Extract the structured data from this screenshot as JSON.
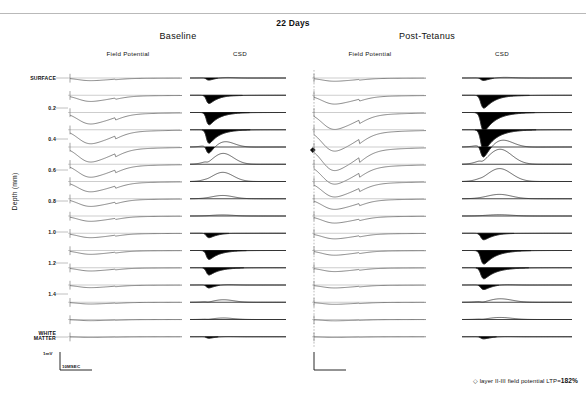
{
  "figure": {
    "title": "22 Days",
    "conditions": [
      {
        "key": "baseline",
        "label": "Baseline"
      },
      {
        "key": "post",
        "label": "Post-Tetanus"
      }
    ],
    "column_labels": {
      "field_potential": "Field Potential",
      "csd": "CSD"
    },
    "y_axis_label": "Depth  (mm)",
    "depth_ticks": [
      {
        "label": "SURFACE",
        "value": 0.0,
        "y": 78
      },
      {
        "label": "0.2",
        "value": 0.2,
        "y": 108
      },
      {
        "label": "0.4",
        "value": 0.4,
        "y": 139
      },
      {
        "label": "0.6",
        "value": 0.6,
        "y": 170
      },
      {
        "label": "0.8",
        "value": 0.8,
        "y": 201
      },
      {
        "label": "1.0",
        "value": 1.0,
        "y": 232
      },
      {
        "label": "1.2",
        "value": 1.2,
        "y": 263
      },
      {
        "label": "1.4",
        "value": 1.4,
        "y": 294
      },
      {
        "label": "WHITE\nMATTER",
        "value": 1.7,
        "y": 337
      }
    ],
    "scale_bar": {
      "voltage": "1mV",
      "time": "10MSEC"
    },
    "annotation": {
      "marker": "◇",
      "text": "layer II-III field potential LTP=",
      "value": "182%"
    }
  },
  "chart_data": {
    "type": "line",
    "title": "22 Days",
    "ylabel": "Depth  (mm)",
    "xlabel": "",
    "ylim": [
      0.0,
      1.7
    ],
    "grid": false,
    "legend": "none",
    "n_channels": 16,
    "channel_depths_mm": [
      0.0,
      0.1,
      0.2,
      0.3,
      0.4,
      0.5,
      0.6,
      0.7,
      0.8,
      0.9,
      1.0,
      1.1,
      1.2,
      1.3,
      1.4,
      1.7
    ],
    "panels": [
      {
        "condition": "Baseline",
        "field_potential": {
          "units": "mV",
          "peak_negativity_mV": [
            -0.18,
            -0.42,
            -0.78,
            -0.95,
            -1.02,
            -0.88,
            -0.7,
            -0.52,
            -0.36,
            -0.3,
            -0.26,
            -0.22,
            -0.18,
            -0.12,
            -0.08,
            -0.04
          ]
        },
        "csd": {
          "units": "mV/mm^2",
          "sink_amplitude": [
            0.3,
            1.0,
            1.45,
            1.6,
            1.1,
            0.25,
            0.05,
            0.0,
            0.0,
            0.55,
            1.05,
            0.85,
            0.4,
            0.1,
            0.05,
            0.2
          ],
          "source_amplitude": [
            0.1,
            0.05,
            0.0,
            0.0,
            0.7,
            1.05,
            0.85,
            0.3,
            0.1,
            0.05,
            0.0,
            0.0,
            0.1,
            0.25,
            0.15,
            0.05
          ]
        }
      },
      {
        "condition": "Post-Tetanus",
        "field_potential": {
          "units": "mV",
          "peak_negativity_mV": [
            -0.22,
            -0.6,
            -1.15,
            -1.45,
            -1.6,
            -1.35,
            -1.05,
            -0.72,
            -0.48,
            -0.38,
            -0.32,
            -0.26,
            -0.2,
            -0.14,
            -0.09,
            -0.04
          ]
        },
        "csd": {
          "units": "mV/mm^2",
          "sink_amplitude": [
            0.35,
            1.55,
            2.2,
            2.45,
            1.7,
            0.35,
            0.08,
            0.0,
            0.0,
            0.8,
            1.6,
            1.3,
            0.6,
            0.15,
            0.06,
            0.28
          ],
          "source_amplitude": [
            0.12,
            0.06,
            0.0,
            0.0,
            0.95,
            1.45,
            1.2,
            0.4,
            0.12,
            0.06,
            0.0,
            0.0,
            0.12,
            0.35,
            0.2,
            0.06
          ]
        }
      }
    ],
    "annotation_value_percent": 182
  }
}
